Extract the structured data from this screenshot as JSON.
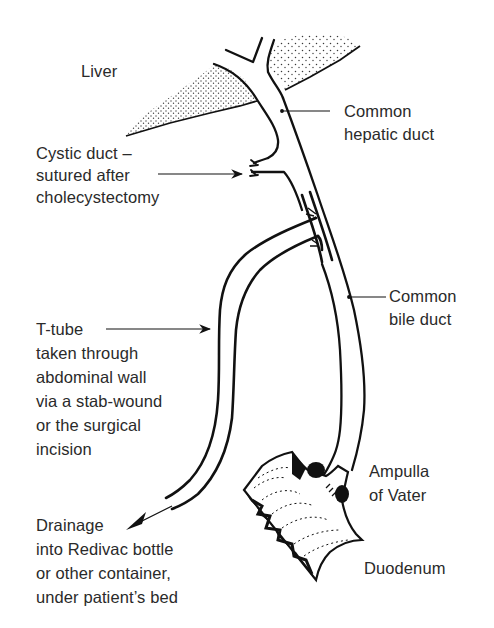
{
  "diagram": {
    "type": "anatomical-illustration",
    "colors": {
      "ink": "#111111",
      "text": "#2a2a2a",
      "background": "#ffffff"
    },
    "labels": {
      "liver": {
        "lines": [
          "Liver"
        ]
      },
      "common_hepatic_duct": {
        "lines": [
          "Common",
          "hepatic duct"
        ]
      },
      "cystic_duct": {
        "lines": [
          "Cystic duct –",
          "sutured after",
          "cholecystectomy"
        ]
      },
      "common_bile_duct": {
        "lines": [
          "Common",
          "bile duct"
        ]
      },
      "t_tube": {
        "lines": [
          "T-tube",
          "taken through",
          "abdominal wall",
          "via a stab-wound",
          "or the surgical",
          "incision"
        ]
      },
      "ampulla": {
        "lines": [
          "Ampulla",
          "of Vater"
        ]
      },
      "drainage": {
        "lines": [
          "Drainage",
          "into Redivac bottle",
          "or other container,",
          "under patient’s bed"
        ]
      },
      "duodenum": {
        "lines": [
          "Duodenum"
        ]
      }
    },
    "structures": [
      "liver",
      "common-hepatic-duct",
      "cystic-duct-stump",
      "common-bile-duct",
      "t-tube",
      "ampulla-of-vater",
      "duodenum",
      "drainage-arrow"
    ]
  }
}
